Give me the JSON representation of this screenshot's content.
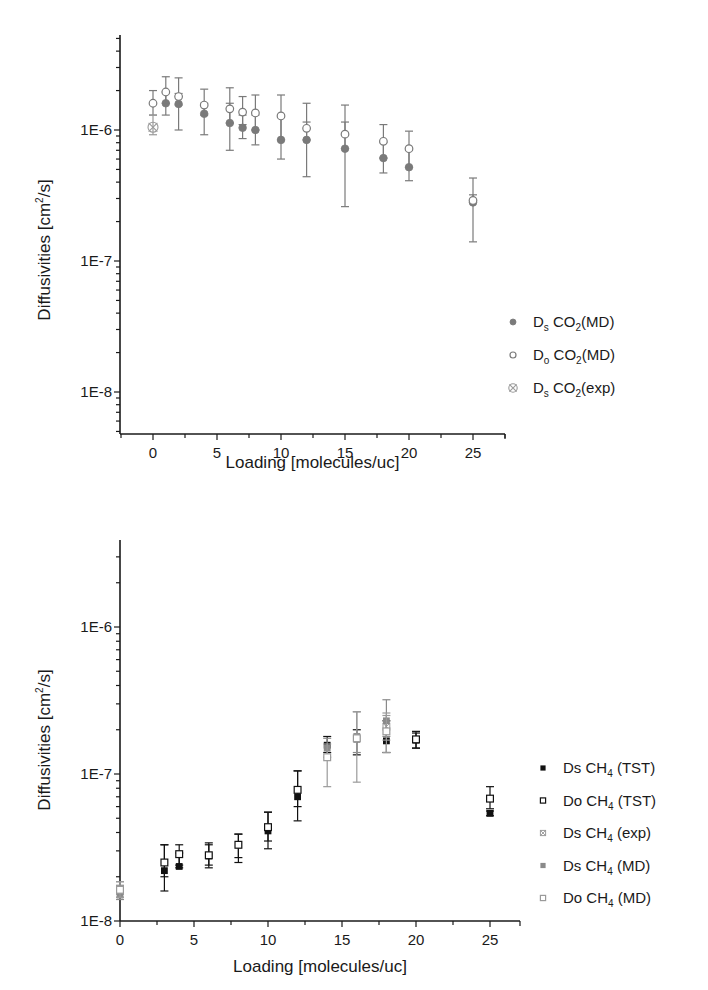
{
  "chart_data": [
    {
      "type": "scatter",
      "yscale": "log",
      "title": "",
      "xlabel": "Loading [molecules/uc]",
      "ylabel": "Diffusivities [cm2/s]",
      "xlim": [
        -2.6,
        27.5
      ],
      "ylim": [
        5e-09,
        3.5e-06
      ],
      "xticks": [
        0,
        5,
        10,
        15,
        20,
        25
      ],
      "yticks": [
        {
          "v": 1e-06,
          "label": "1E-6"
        },
        {
          "v": 1e-07,
          "label": "1E-7"
        },
        {
          "v": 1e-08,
          "label": "1E-8"
        }
      ],
      "grid": false,
      "legend_position": "right",
      "series": [
        {
          "name": "Ds CO2(MD)",
          "label_main": "D",
          "label_sub1": "s",
          "label_mid": " CO",
          "label_sub2": "2",
          "label_end": "(MD)",
          "marker": "filled-circle",
          "color": "#7a7a7a",
          "points": [
            {
              "x": 1,
              "y": 1.6e-06,
              "lo": 1.3e-06,
              "hi": 1.95e-06
            },
            {
              "x": 2,
              "y": 1.58e-06,
              "lo": 1e-06,
              "hi": 1.9e-06
            },
            {
              "x": 4,
              "y": 1.33e-06,
              "lo": 9.2e-07,
              "hi": 1.6e-06
            },
            {
              "x": 6,
              "y": 1.13e-06,
              "lo": 7e-07,
              "hi": 1.6e-06
            },
            {
              "x": 7,
              "y": 1.04e-06,
              "lo": 8.6e-07,
              "hi": 1.3e-06
            },
            {
              "x": 8,
              "y": 1e-06,
              "lo": 7.7e-07,
              "hi": 1.3e-06
            },
            {
              "x": 10,
              "y": 8.4e-07,
              "lo": 6e-07,
              "hi": 1.25e-06
            },
            {
              "x": 12,
              "y": 8.4e-07,
              "lo": 4.4e-07,
              "hi": 1.15e-06
            },
            {
              "x": 15,
              "y": 7.2e-07,
              "lo": 2.6e-07,
              "hi": 1.15e-06
            },
            {
              "x": 18,
              "y": 6.1e-07,
              "lo": 4.7e-07,
              "hi": 8e-07
            },
            {
              "x": 20,
              "y": 5.2e-07,
              "lo": 4.1e-07,
              "hi": 7e-07
            },
            {
              "x": 25,
              "y": 2.8e-07,
              "lo": 1.4e-07,
              "hi": 3.2e-07
            }
          ]
        },
        {
          "name": "Do CO2(MD)",
          "label_main": "D",
          "label_sub1": "o",
          "label_mid": " CO",
          "label_sub2": "2",
          "label_end": "(MD)",
          "marker": "open-circle",
          "color": "#7a7a7a",
          "points": [
            {
              "x": 0,
              "y": 1.6e-06,
              "lo": 1.3e-06,
              "hi": 2e-06
            },
            {
              "x": 1,
              "y": 1.95e-06,
              "lo": 1.6e-06,
              "hi": 2.55e-06
            },
            {
              "x": 2,
              "y": 1.8e-06,
              "lo": 1.55e-06,
              "hi": 2.5e-06
            },
            {
              "x": 4,
              "y": 1.55e-06,
              "lo": 1.3e-06,
              "hi": 2.05e-06
            },
            {
              "x": 6,
              "y": 1.45e-06,
              "lo": 1.13e-06,
              "hi": 2.1e-06
            },
            {
              "x": 7,
              "y": 1.37e-06,
              "lo": 1.1e-06,
              "hi": 1.8e-06
            },
            {
              "x": 8,
              "y": 1.35e-06,
              "lo": 1e-06,
              "hi": 1.85e-06
            },
            {
              "x": 10,
              "y": 1.28e-06,
              "lo": 8.4e-07,
              "hi": 1.85e-06
            },
            {
              "x": 12,
              "y": 1.03e-06,
              "lo": 8.4e-07,
              "hi": 1.6e-06
            },
            {
              "x": 15,
              "y": 9.3e-07,
              "lo": 7.2e-07,
              "hi": 1.55e-06
            },
            {
              "x": 18,
              "y": 8.2e-07,
              "lo": 6.1e-07,
              "hi": 1.1e-06
            },
            {
              "x": 20,
              "y": 7.2e-07,
              "lo": 5.2e-07,
              "hi": 9.8e-07
            },
            {
              "x": 25,
              "y": 2.9e-07,
              "lo": 2.8e-07,
              "hi": 4.3e-07
            }
          ]
        },
        {
          "name": "Ds CO2(exp)",
          "label_main": "D",
          "label_sub1": "s",
          "label_mid": " CO",
          "label_sub2": "2",
          "label_end": "(exp)",
          "marker": "crossed-circle",
          "color": "#9a9a9a",
          "points": [
            {
              "x": 0,
              "y": 1.05e-06,
              "lo": 9.2e-07,
              "hi": 1.3e-06
            }
          ]
        }
      ]
    },
    {
      "type": "scatter",
      "yscale": "log",
      "title": "",
      "xlabel": "Loading [molecules/uc]",
      "ylabel": "Diffusivities [cm2/s]",
      "xlim": [
        0,
        27
      ],
      "ylim": [
        1e-08,
        4e-06
      ],
      "xticks": [
        0,
        5,
        10,
        15,
        20,
        25
      ],
      "yticks": [
        {
          "v": 1e-06,
          "label": "1E-6"
        },
        {
          "v": 1e-07,
          "label": "1E-7"
        },
        {
          "v": 1e-08,
          "label": "1E-8"
        }
      ],
      "grid": false,
      "legend_position": "right",
      "series": [
        {
          "name": "Ds CH4 (TST)",
          "label_main": "Ds CH",
          "label_sub2": "4",
          "label_end": " (TST)",
          "marker": "filled-square",
          "color": "#111111",
          "points": [
            {
              "x": 3,
              "y": 2.2e-08,
              "lo": 1.6e-08,
              "hi": 3.3e-08
            },
            {
              "x": 4,
              "y": 2.35e-08,
              "lo": 2.3e-08,
              "hi": 2.9e-08
            },
            {
              "x": 6,
              "y": 2.77e-08,
              "lo": 2.3e-08,
              "hi": 3.3e-08
            },
            {
              "x": 8,
              "y": 3.3e-08,
              "lo": 2.5e-08,
              "hi": 3.9e-08
            },
            {
              "x": 10,
              "y": 4.1e-08,
              "lo": 3.1e-08,
              "hi": 5.5e-08
            },
            {
              "x": 12,
              "y": 7e-08,
              "lo": 4.8e-08,
              "hi": 1.05e-07
            },
            {
              "x": 14,
              "y": 1.57e-07,
              "lo": 1.4e-07,
              "hi": 1.8e-07
            },
            {
              "x": 16,
              "y": 1.73e-07,
              "lo": 1.35e-07,
              "hi": 2e-07
            },
            {
              "x": 18,
              "y": 1.68e-07,
              "lo": 1.4e-07,
              "hi": 2.3e-07
            },
            {
              "x": 20,
              "y": 1.7e-07,
              "lo": 1.5e-07,
              "hi": 1.9e-07
            },
            {
              "x": 25,
              "y": 5.4e-08,
              "lo": 5.2e-08,
              "hi": 5.6e-08
            }
          ]
        },
        {
          "name": "Do CH4 (TST)",
          "label_main": "Do CH",
          "label_sub2": "4",
          "label_end": " (TST)",
          "marker": "open-square",
          "color": "#111111",
          "points": [
            {
              "x": 3,
              "y": 2.5e-08,
              "lo": 2e-08,
              "hi": 3.3e-08
            },
            {
              "x": 4,
              "y": 2.85e-08,
              "lo": 2.4e-08,
              "hi": 3.3e-08
            },
            {
              "x": 6,
              "y": 2.8e-08,
              "lo": 2.4e-08,
              "hi": 3.4e-08
            },
            {
              "x": 8,
              "y": 3.3e-08,
              "lo": 2.7e-08,
              "hi": 3.9e-08
            },
            {
              "x": 10,
              "y": 4.35e-08,
              "lo": 3.5e-08,
              "hi": 5.5e-08
            },
            {
              "x": 12,
              "y": 7.8e-08,
              "lo": 6e-08,
              "hi": 1.05e-07
            },
            {
              "x": 20,
              "y": 1.72e-07,
              "lo": 1.5e-07,
              "hi": 1.95e-07
            },
            {
              "x": 25,
              "y": 6.8e-08,
              "lo": 5.8e-08,
              "hi": 8.2e-08
            }
          ]
        },
        {
          "name": "Ds CH4 (exp)",
          "label_main": "Ds CH",
          "label_sub2": "4",
          "label_end": " (exp)",
          "marker": "crossed-square",
          "color": "#9a9a9a",
          "points": [
            {
              "x": 0,
              "y": 1.6e-08,
              "lo": 1.45e-08,
              "hi": 1.85e-08
            },
            {
              "x": 18,
              "y": 2.1e-07,
              "lo": 1.7e-07,
              "hi": 2.5e-07
            }
          ]
        },
        {
          "name": "Ds CH4 (MD)",
          "label_main": "Ds CH",
          "label_sub2": "4",
          "label_end": " (MD)",
          "marker": "filled-square",
          "color": "#8a8a8a",
          "points": [
            {
              "x": 0,
              "y": 1.5e-08,
              "lo": 1.4e-08,
              "hi": 1.75e-08
            },
            {
              "x": 14,
              "y": 1.5e-07,
              "lo": 1.3e-07,
              "hi": 1.75e-07
            },
            {
              "x": 16,
              "y": 1.8e-07,
              "lo": 1.4e-07,
              "hi": 2.65e-07
            },
            {
              "x": 18,
              "y": 2.3e-07,
              "lo": 1.8e-07,
              "hi": 3.2e-07
            }
          ]
        },
        {
          "name": "Do CH4 (MD)",
          "label_main": "Do CH",
          "label_sub2": "4",
          "label_end": " (MD)",
          "marker": "open-square",
          "color": "#9a9a9a",
          "points": [
            {
              "x": 0,
              "y": 1.63e-08,
              "lo": 1.45e-08,
              "hi": 1.85e-08
            },
            {
              "x": 14,
              "y": 1.3e-07,
              "lo": 8.2e-08,
              "hi": 1.6e-07
            },
            {
              "x": 16,
              "y": 1.75e-07,
              "lo": 8.8e-08,
              "hi": 2.65e-07
            },
            {
              "x": 18,
              "y": 1.95e-07,
              "lo": 1.4e-07,
              "hi": 2.6e-07
            }
          ]
        }
      ]
    }
  ],
  "layout": {
    "panels": [
      {
        "x0": 120,
        "x1": 505,
        "yTop": 35,
        "yAxis": 434,
        "xAtZero": 153,
        "pxPerUnit": 12.8,
        "yRef": 1e-06,
        "yRefPx": 130,
        "decadePx": 131,
        "ylabelX": 50,
        "ylabelY": 250,
        "xlabelY": 468,
        "legendX": 513,
        "legendTextX": 533,
        "legendY0": 322,
        "legendDy": 33
      },
      {
        "x0": 120,
        "x1": 520,
        "yTop": 540,
        "yAxis": 921,
        "xAtZero": 120,
        "pxPerUnit": 14.8,
        "yRef": 1e-07,
        "yRefPx": 774,
        "decadePx": 147,
        "ylabelX": 50,
        "ylabelY": 740,
        "xlabelY": 972,
        "legendX": 543,
        "legendTextX": 563,
        "legendY0": 768,
        "legendDy": 32.5
      }
    ]
  }
}
